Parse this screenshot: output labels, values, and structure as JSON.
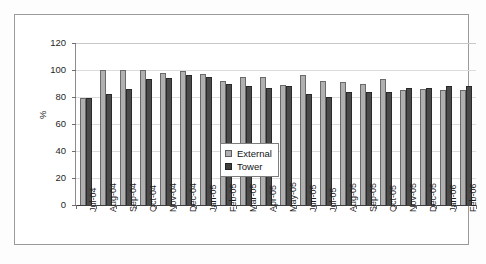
{
  "chart_data": {
    "type": "bar",
    "title": "",
    "xlabel": "",
    "ylabel": "%",
    "ylim": [
      0,
      120
    ],
    "yticks": [
      0,
      20,
      40,
      60,
      80,
      100,
      120
    ],
    "grid": true,
    "legend_position": "center-right-inside",
    "categories": [
      "Jul-04",
      "Aug-04",
      "Sep-04",
      "Oct-04",
      "Nov-04",
      "Dec-04",
      "Jan-05",
      "Feb-05",
      "Mar-05",
      "Apr-05",
      "May-05",
      "Jun-05",
      "Jul-05",
      "Aug-05",
      "Sep-05",
      "Oct-05",
      "Nov-05",
      "Dec-05",
      "Jan-06",
      "Feb-06"
    ],
    "series": [
      {
        "name": "External",
        "color": "#b0b0b0",
        "values": [
          79,
          100,
          100,
          100,
          98,
          99,
          97,
          92,
          95,
          95,
          89,
          96,
          92,
          91,
          90,
          93,
          85,
          86,
          85,
          85
        ]
      },
      {
        "name": "Tower",
        "color": "#4a4a4a",
        "values": [
          79,
          82,
          86,
          93,
          94,
          96,
          95,
          90,
          88,
          87,
          88,
          82,
          80,
          84,
          84,
          84,
          87,
          87,
          88,
          88
        ]
      }
    ]
  },
  "legend": {
    "items": [
      {
        "label": "External",
        "swatch": "external"
      },
      {
        "label": "Tower",
        "swatch": "tower"
      }
    ]
  },
  "axes": {
    "y_title": "%"
  }
}
